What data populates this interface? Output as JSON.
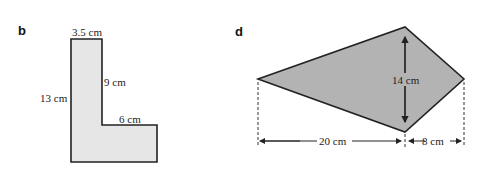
{
  "figures": [
    {
      "part_label": "b",
      "shape": "L-shape",
      "fill_color": "#e6e6e6",
      "dimensions": {
        "top": "3.5 cm",
        "inner_vertical": "9 cm",
        "left": "13 cm",
        "inner_horizontal": "6 cm"
      }
    },
    {
      "part_label": "d",
      "shape": "kite",
      "fill_color": "#b3b3b3",
      "dimensions": {
        "diagonal": "14 cm",
        "left_span": "20 cm",
        "right_span": "8 cm"
      }
    }
  ]
}
